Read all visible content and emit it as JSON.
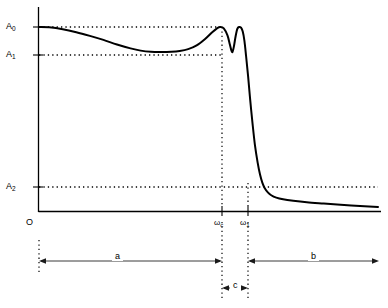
{
  "chart_data": {
    "type": "line",
    "title": "",
    "subtitle": "",
    "xlabel": "",
    "ylabel": "",
    "grid": false,
    "legend": null,
    "axis": {
      "x_origin_label": "O",
      "x_ticks": [
        {
          "label": "ωc",
          "base": "ω",
          "sub": "c",
          "x": 0.58
        },
        {
          "label": "ω1",
          "base": "ω",
          "sub": "1",
          "x": 0.665
        }
      ],
      "y_ticks": [
        {
          "label": "A0",
          "base": "A",
          "sub": "0",
          "y": 1.0
        },
        {
          "label": "A1",
          "base": "A",
          "sub": "1",
          "y": 0.865
        },
        {
          "label": "A2",
          "base": "A",
          "sub": "2",
          "y": 0.125
        }
      ],
      "xlim": [
        0,
        1
      ],
      "ylim": [
        0,
        1.06
      ]
    },
    "reference_lines": [
      {
        "name": "A0-level",
        "value": 1.0,
        "orientation": "horizontal",
        "style": "dotted",
        "from_x": 0.0,
        "to_x": 0.58
      },
      {
        "name": "A1-level",
        "value": 0.865,
        "orientation": "horizontal",
        "style": "dotted",
        "from_x": 0.0,
        "to_x": 0.58
      },
      {
        "name": "A2-level",
        "value": 0.125,
        "orientation": "horizontal",
        "style": "dotted",
        "from_x": 0.0,
        "to_x": 1.0
      },
      {
        "name": "omega-c-line",
        "value": 0.58,
        "orientation": "vertical",
        "style": "dotted"
      },
      {
        "name": "omega-1-line",
        "value": 0.665,
        "orientation": "vertical",
        "style": "dotted"
      }
    ],
    "series": [
      {
        "name": "magnitude-response",
        "color": "#000000",
        "points": [
          [
            0.0,
            1.0
          ],
          [
            0.03,
            0.998
          ],
          [
            0.07,
            0.988
          ],
          [
            0.11,
            0.972
          ],
          [
            0.15,
            0.952
          ],
          [
            0.19,
            0.93
          ],
          [
            0.23,
            0.905
          ],
          [
            0.27,
            0.884
          ],
          [
            0.3,
            0.872
          ],
          [
            0.33,
            0.866
          ],
          [
            0.36,
            0.865
          ],
          [
            0.39,
            0.866
          ],
          [
            0.415,
            0.87
          ],
          [
            0.44,
            0.88
          ],
          [
            0.465,
            0.9
          ],
          [
            0.49,
            0.935
          ],
          [
            0.51,
            0.97
          ],
          [
            0.525,
            0.993
          ],
          [
            0.535,
            1.0
          ],
          [
            0.545,
            0.993
          ],
          [
            0.556,
            0.955
          ],
          [
            0.563,
            0.905
          ],
          [
            0.568,
            0.87
          ],
          [
            0.571,
            0.866
          ],
          [
            0.575,
            0.895
          ],
          [
            0.58,
            0.95
          ],
          [
            0.585,
            0.99
          ],
          [
            0.59,
            1.0
          ],
          [
            0.596,
            0.996
          ],
          [
            0.601,
            0.975
          ],
          [
            0.606,
            0.925
          ],
          [
            0.611,
            0.84
          ],
          [
            0.617,
            0.73
          ],
          [
            0.623,
            0.605
          ],
          [
            0.63,
            0.475
          ],
          [
            0.637,
            0.36
          ],
          [
            0.645,
            0.265
          ],
          [
            0.652,
            0.2
          ],
          [
            0.659,
            0.155
          ],
          [
            0.666,
            0.126
          ],
          [
            0.675,
            0.104
          ],
          [
            0.685,
            0.088
          ],
          [
            0.7,
            0.075
          ],
          [
            0.72,
            0.066
          ],
          [
            0.75,
            0.058
          ],
          [
            0.79,
            0.05
          ],
          [
            0.84,
            0.043
          ],
          [
            0.9,
            0.035
          ],
          [
            0.96,
            0.028
          ],
          [
            1.0,
            0.024
          ]
        ]
      }
    ],
    "annotations": [
      {
        "name": "band-a",
        "label": "a",
        "type": "span-arrow",
        "from_x": 0.0,
        "to_x": 0.58,
        "description": "passband"
      },
      {
        "name": "band-b",
        "label": "b",
        "type": "span-arrow",
        "from_x": 0.665,
        "to_x": 1.0,
        "description": "stopband"
      },
      {
        "name": "band-c",
        "label": "c",
        "type": "span-arrow",
        "from_x": 0.58,
        "to_x": 0.665,
        "description": "transition band"
      }
    ]
  },
  "labels": {
    "A0": "A",
    "A0_sub": "0",
    "A1": "A",
    "A1_sub": "1",
    "A2": "A",
    "A2_sub": "2",
    "origin": "O",
    "omega_c": "ω",
    "omega_c_sub": "c",
    "omega_1": "ω",
    "omega_1_sub": "1",
    "span_a": "a",
    "span_b": "b",
    "span_c": "c"
  },
  "colors": {
    "curve": "#000000",
    "axis": "#000000",
    "dotted": "#000000",
    "background": "#ffffff"
  }
}
